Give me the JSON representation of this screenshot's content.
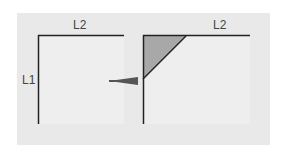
{
  "diagram": {
    "left_square": {
      "label_top": "L2",
      "label_side": "L1"
    },
    "right_square": {
      "label_top": "L2"
    },
    "arrow": "right-arrow",
    "colors": {
      "background": "#e9e9e9",
      "fill": "#ededed",
      "line": "#222222",
      "triangle": "#a8a8a8",
      "arrow": "#555555"
    }
  }
}
